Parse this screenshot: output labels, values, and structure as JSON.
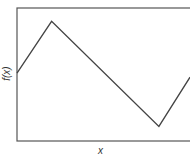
{
  "chart_data": {
    "type": "line",
    "title": "",
    "xlabel": "x",
    "ylabel": "f(x)",
    "grid": false,
    "legend": null,
    "series": [
      {
        "name": "f(x)",
        "x": [
          0,
          0.2,
          0.82,
          1.0
        ],
        "y": [
          0.51,
          0.9,
          0.11,
          0.48
        ]
      }
    ],
    "xlim": [
      0,
      1
    ],
    "ylim": [
      0,
      1
    ],
    "ticks": "none"
  },
  "colors": {
    "line": "#444444",
    "frame": "#555555"
  }
}
